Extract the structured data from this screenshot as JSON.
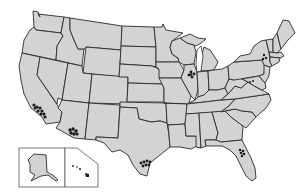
{
  "map": {
    "title": "",
    "region": "United States",
    "fill_color": "#d3d3d3",
    "border_color": "#2a2a2a",
    "background": "#ffffff",
    "marker_color": "#1a1a1a",
    "insets": [
      "Alaska",
      "Hawaii"
    ],
    "marker_clusters": [
      {
        "location": "Southern California (Los Angeles area)",
        "x": 40,
        "y": 110
      },
      {
        "location": "Arizona (Phoenix area)",
        "x": 73,
        "y": 132
      },
      {
        "location": "Illinois (Chicago area)",
        "x": 191,
        "y": 74
      },
      {
        "location": "New York (Hudson Valley area)",
        "x": 264,
        "y": 57
      },
      {
        "location": "Pennsylvania / Maryland border",
        "x": 250,
        "y": 82
      },
      {
        "location": "Texas (Houston area)",
        "x": 146,
        "y": 164
      },
      {
        "location": "Florida (Orlando area)",
        "x": 242,
        "y": 152
      },
      {
        "location": "Hawaii (Big Island)",
        "x": 88,
        "y": 175
      }
    ]
  }
}
